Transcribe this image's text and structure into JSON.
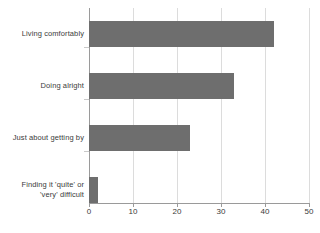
{
  "chart_data": {
    "type": "bar",
    "orientation": "horizontal",
    "title": "",
    "subtitle": "",
    "xlabel": "",
    "ylabel": "",
    "categories": [
      "Living comfortably",
      "Doing alright",
      "Just about getting by",
      "Finding it 'quite' or\n'very' difficult"
    ],
    "category_lines": [
      [
        "Living comfortably"
      ],
      [
        "Doing alright"
      ],
      [
        "Just about getting by"
      ],
      [
        "Finding it 'quite' or",
        "'very' difficult"
      ]
    ],
    "values": [
      42,
      33,
      23,
      2
    ],
    "xlim": [
      0,
      50
    ],
    "xticks": [
      0,
      10,
      20,
      30,
      40,
      50
    ],
    "xtick_labels": [
      "0",
      "10",
      "20",
      "30",
      "40",
      "50"
    ],
    "grid": "vertical",
    "legend": "none",
    "annotations": [],
    "series": [
      {
        "name": "",
        "values": [
          42,
          33,
          23,
          2
        ]
      }
    ]
  },
  "style": {
    "bar_color": "#6e6e6e",
    "gridline_color": "#dcdcdc",
    "axis_color": "#9a9a9a",
    "text_color": "#3b3b3b",
    "background": "#ffffff"
  }
}
